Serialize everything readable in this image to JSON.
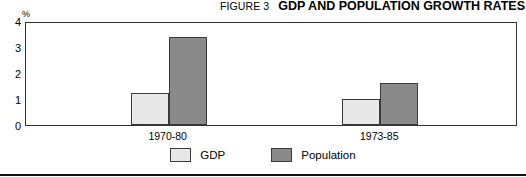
{
  "header": {
    "figure_number": "FIGURE 3",
    "title": "GDP AND POPULATION GROWTH RATES"
  },
  "axis": {
    "y_unit": "%",
    "y_ticks": [
      "0",
      "1",
      "2",
      "3",
      "4"
    ]
  },
  "legend": {
    "items": [
      {
        "label": "GDP",
        "color": "#e8e8e8"
      },
      {
        "label": "Population",
        "color": "#8a8a8a"
      }
    ]
  },
  "chart_data": {
    "type": "bar",
    "title": "GDP AND POPULATION GROWTH RATES",
    "subtitle": "FIGURE 3",
    "xlabel": "",
    "ylabel": "%",
    "ylim": [
      0,
      4
    ],
    "yticks": [
      0,
      1,
      2,
      3,
      4
    ],
    "grid": false,
    "legend_position": "bottom-center",
    "categories": [
      "1970-80",
      "1973-85"
    ],
    "series": [
      {
        "name": "GDP",
        "color": "#e8e8e8",
        "values": [
          1.25,
          1.0
        ]
      },
      {
        "name": "Population",
        "color": "#8a8a8a",
        "values": [
          3.4,
          1.6
        ]
      }
    ]
  }
}
